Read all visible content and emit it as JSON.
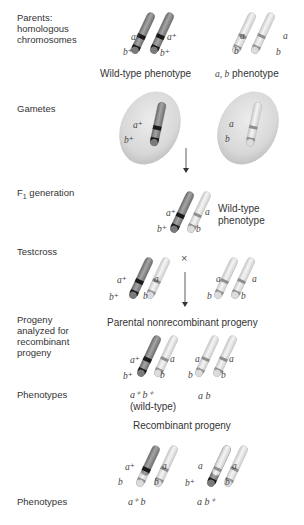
{
  "row_labels": {
    "parents": "Parents:\nhomologous\nchromosomes",
    "gametes": "Gametes",
    "f1": "F",
    "f1_sub": "1",
    "f1_rest": " generation",
    "testcross": "Testcross",
    "progeny": "Progeny\nanalyzed for\nrecombinant\nprogeny",
    "phenotypes1": "Phenotypes",
    "phenotypes2": "Phenotypes"
  },
  "captions": {
    "wild_type_phenotype": "Wild-type phenotype",
    "ab_phenotype_italic": "a, b",
    "ab_phenotype_rest": " phenotype",
    "f1_wild_type": "Wild-type\nphenotype",
    "parental_nonrecombinant": "Parental nonrecombinant progeny",
    "recombinant": "Recombinant progeny",
    "wild_type_paren": "(wild-type)"
  },
  "alleles": {
    "a_plus": "a⁺",
    "b_plus": "b⁺",
    "a": "a",
    "b": "b"
  },
  "phenotypes": {
    "nonrecomb_1": "a⁺ b⁺",
    "nonrecomb_2": "a b",
    "recomb_1": "a⁺ b",
    "recomb_2": "a b⁺"
  },
  "symbols": {
    "cross": "×"
  },
  "colors": {
    "wild_chromosome": "#8a8a8a",
    "mutant_chromosome": "#e4e4e4",
    "wild_band": "#1a1a1a",
    "mutant_band": "#8c8c8c",
    "gamete_cell": "#d9d9d9"
  }
}
